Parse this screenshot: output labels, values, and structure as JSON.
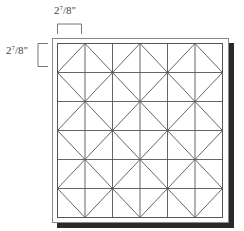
{
  "diagram": {
    "dimension_top": {
      "whole": "2",
      "num": "7",
      "den": "8",
      "unit": "\""
    },
    "dimension_left": {
      "whole": "2",
      "num": "7",
      "den": "8",
      "unit": "\""
    },
    "grid": {
      "columns": 6,
      "rows": 6
    },
    "colors": {
      "line": "#555555",
      "frame": "#888888",
      "shadow": "#2a2a2a",
      "background": "#ffffff"
    }
  }
}
